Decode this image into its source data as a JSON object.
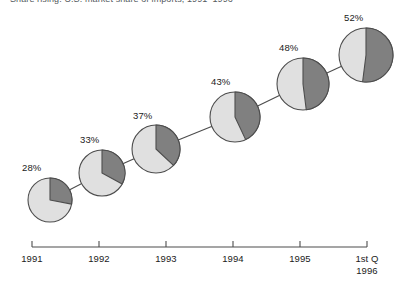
{
  "chart_data": {
    "type": "pie",
    "title": "Share rising: U.S. market share of imports, 1991–1996",
    "xlabel": "",
    "ylabel": "",
    "grid": false,
    "legend": null,
    "categories": [
      "1991",
      "1992",
      "1993",
      "1994",
      "1995",
      "1st Q\n1996"
    ],
    "values": [
      28,
      33,
      37,
      43,
      48,
      52
    ],
    "value_labels": [
      "28%",
      "33%",
      "37%",
      "43%",
      "48%",
      "52%"
    ],
    "units": "percent",
    "slice_colors": {
      "highlight": "#808080",
      "remainder": "#e0e0e0",
      "outline": "#4d4d4d"
    }
  },
  "axis": {
    "line_color": "#4d4d4d",
    "ticks": [
      "1991",
      "1992",
      "1993",
      "1994",
      "1995",
      "1st Q"
    ],
    "last_tick_second_line": "1996"
  },
  "pies": [
    {
      "label": "28%",
      "value": 28,
      "cx": 50,
      "cy": 200,
      "r": 22,
      "label_x": 22,
      "label_y": 162
    },
    {
      "label": "33%",
      "value": 33,
      "cx": 102,
      "cy": 173,
      "r": 23,
      "label_x": 80,
      "label_y": 134
    },
    {
      "label": "37%",
      "value": 37,
      "cx": 156,
      "cy": 149,
      "r": 24,
      "label_x": 133,
      "label_y": 110
    },
    {
      "label": "43%",
      "value": 43,
      "cx": 235,
      "cy": 117,
      "r": 25,
      "label_x": 211,
      "label_y": 76
    },
    {
      "label": "48%",
      "value": 48,
      "cx": 303,
      "cy": 84,
      "r": 26,
      "label_x": 279,
      "label_y": 42
    },
    {
      "label": "52%",
      "value": 52,
      "cx": 366,
      "cy": 55,
      "r": 27,
      "label_x": 344,
      "label_y": 12
    }
  ]
}
